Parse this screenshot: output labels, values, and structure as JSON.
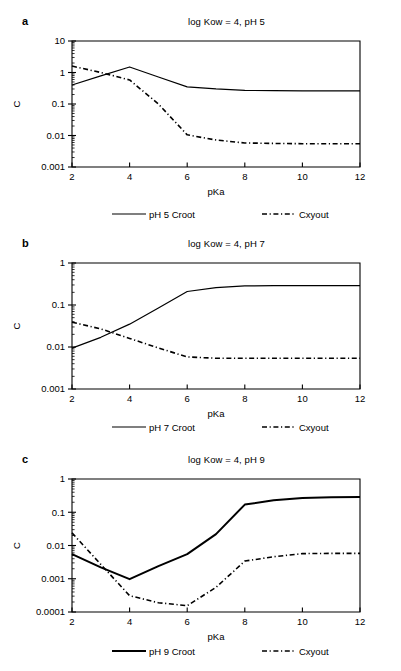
{
  "figure": {
    "panels": [
      {
        "key": "a",
        "label": "a",
        "title": "log Kow = 4, pH 5",
        "legend": [
          {
            "name": "legend-croot",
            "label": "pH 5 Croot",
            "style": "solid"
          },
          {
            "name": "legend-cxyout",
            "label": "Cxyout",
            "style": "dashdot"
          }
        ],
        "chart_data": {
          "type": "line",
          "title": "log Kow = 4, pH 5",
          "xlabel": "pKa",
          "ylabel": "C",
          "xlim": [
            2,
            12
          ],
          "ylim": [
            0.001,
            10
          ],
          "yscale": "log",
          "grid": false,
          "legend_position": "below",
          "xticks": [
            2,
            4,
            6,
            8,
            10,
            12
          ],
          "yticks": [
            0.001,
            0.01,
            0.1,
            1,
            10
          ],
          "ytick_labels": [
            "0.001",
            "0.01",
            "0.1",
            "1",
            "10"
          ],
          "x": [
            2,
            3,
            4,
            5,
            6,
            7,
            8,
            9,
            10,
            11,
            12
          ],
          "series": [
            {
              "name": "pH 5 Croot",
              "style": "solid",
              "width": 1.2,
              "values": [
                0.4,
                0.78,
                1.5,
                0.72,
                0.35,
                0.3,
                0.27,
                0.265,
                0.26,
                0.26,
                0.26
              ]
            },
            {
              "name": "Cxyout",
              "style": "dashdot",
              "width": 1.6,
              "values": [
                1.6,
                1.0,
                0.58,
                0.1,
                0.0105,
                0.0072,
                0.0058,
                0.0056,
                0.0055,
                0.0055,
                0.0055
              ]
            }
          ]
        }
      },
      {
        "key": "b",
        "label": "b",
        "title": "log Kow = 4, pH 7",
        "legend": [
          {
            "name": "legend-croot",
            "label": "pH 7 Croot",
            "style": "solid"
          },
          {
            "name": "legend-cxyout",
            "label": "Cxyout",
            "style": "dashdot"
          }
        ],
        "chart_data": {
          "type": "line",
          "title": "log Kow = 4, pH 7",
          "xlabel": "pKa",
          "ylabel": "C",
          "xlim": [
            2,
            12
          ],
          "ylim": [
            0.001,
            1
          ],
          "yscale": "log",
          "grid": false,
          "legend_position": "below",
          "xticks": [
            2,
            4,
            6,
            8,
            10,
            12
          ],
          "yticks": [
            0.001,
            0.01,
            0.1,
            1
          ],
          "ytick_labels": [
            "0.001",
            "0.01",
            "0.1",
            "1"
          ],
          "x": [
            2,
            3,
            4,
            5,
            6,
            7,
            8,
            9,
            10,
            11,
            12
          ],
          "series": [
            {
              "name": "pH 7 Croot",
              "style": "solid",
              "width": 1.2,
              "values": [
                0.0094,
                0.017,
                0.035,
                0.085,
                0.21,
                0.26,
                0.285,
                0.29,
                0.29,
                0.29,
                0.29
              ]
            },
            {
              "name": "Cxyout",
              "style": "dashdot",
              "width": 1.6,
              "values": [
                0.039,
                0.027,
                0.016,
                0.0095,
                0.0058,
                0.0054,
                0.0054,
                0.0054,
                0.0054,
                0.0054,
                0.0054
              ]
            }
          ]
        }
      },
      {
        "key": "c",
        "label": "c",
        "title": "log Kow = 4, pH 9",
        "legend": [
          {
            "name": "legend-croot",
            "label": "pH 9 Croot",
            "style": "solid-bold"
          },
          {
            "name": "legend-cxyout",
            "label": "Cxyout",
            "style": "dashdot"
          }
        ],
        "chart_data": {
          "type": "line",
          "title": "log Kow = 4, pH 9",
          "xlabel": "pKa",
          "ylabel": "C",
          "xlim": [
            2,
            12
          ],
          "ylim": [
            0.0001,
            1
          ],
          "yscale": "log",
          "grid": false,
          "legend_position": "below",
          "xticks": [
            2,
            4,
            6,
            8,
            10,
            12
          ],
          "yticks": [
            0.0001,
            0.001,
            0.01,
            0.1,
            1
          ],
          "ytick_labels": [
            "0.0001",
            "0.001",
            "0.01",
            "0.1",
            "1"
          ],
          "x": [
            2,
            3,
            4,
            5,
            6,
            7,
            8,
            9,
            10,
            11,
            12
          ],
          "series": [
            {
              "name": "pH 9 Croot",
              "style": "solid-bold",
              "width": 2.0,
              "values": [
                0.0055,
                0.0022,
                0.00097,
                0.0024,
                0.0055,
                0.022,
                0.17,
                0.23,
                0.27,
                0.285,
                0.29
              ]
            },
            {
              "name": "Cxyout",
              "style": "dashdot",
              "width": 1.6,
              "values": [
                0.024,
                0.0027,
                0.00031,
                0.00019,
                0.000155,
                0.00055,
                0.0034,
                0.0046,
                0.0057,
                0.0058,
                0.0058
              ]
            }
          ]
        }
      }
    ]
  }
}
